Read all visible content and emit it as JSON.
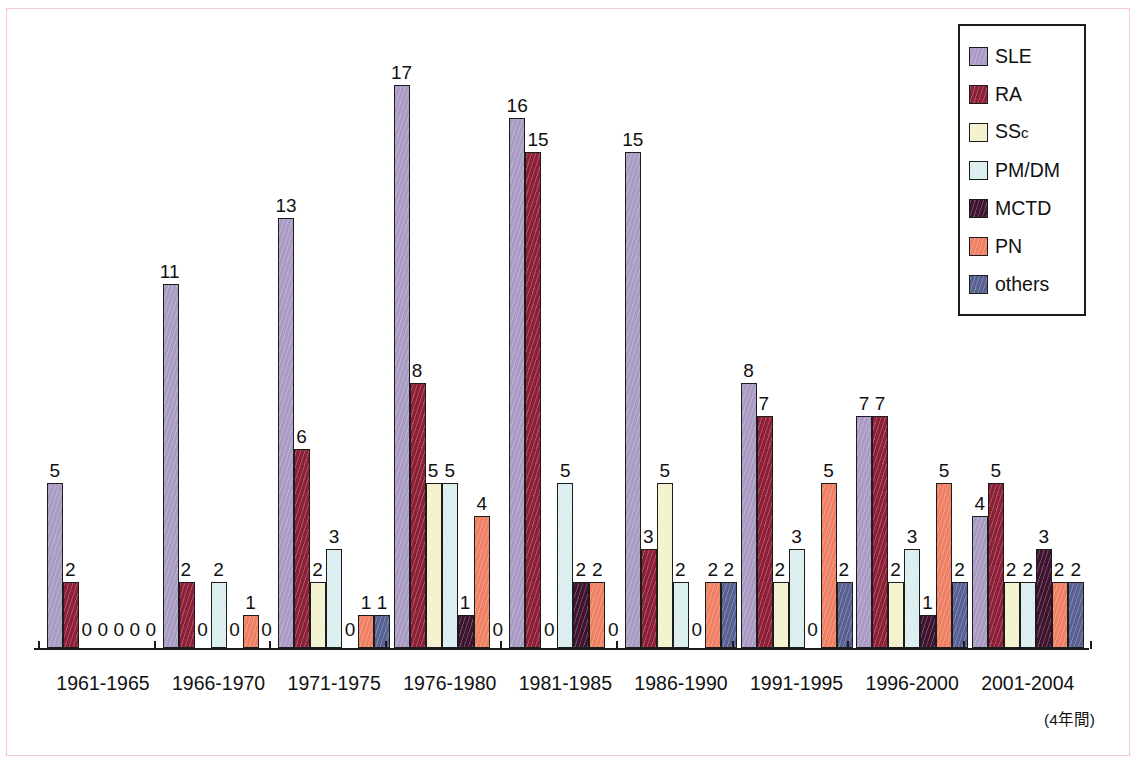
{
  "chart_data": {
    "type": "bar",
    "title": "",
    "subtitle": "",
    "xlabel": "",
    "ylabel": "",
    "grid": false,
    "legend_position": "top-right",
    "ylim": [
      0,
      17
    ],
    "note": "(4年間)",
    "categories": [
      "1961-1965",
      "1966-1970",
      "1971-1975",
      "1976-1980",
      "1981-1985",
      "1986-1990",
      "1991-1995",
      "1996-2000",
      "2001-2004"
    ],
    "series": [
      {
        "name": "SLE",
        "color": "#a99bc4",
        "values": [
          5,
          11,
          13,
          17,
          16,
          15,
          8,
          7,
          4
        ]
      },
      {
        "name": "RA",
        "color": "#8d2037",
        "values": [
          2,
          2,
          6,
          8,
          15,
          3,
          7,
          7,
          5
        ]
      },
      {
        "name": "SSc",
        "color": "#f4f2cc",
        "values": [
          0,
          0,
          2,
          5,
          0,
          5,
          2,
          2,
          2
        ]
      },
      {
        "name": "PM/DM",
        "color": "#daeef0",
        "values": [
          0,
          2,
          3,
          5,
          5,
          2,
          3,
          3,
          2
        ]
      },
      {
        "name": "MCTD",
        "color": "#3f1430",
        "values": [
          0,
          0,
          0,
          1,
          2,
          0,
          0,
          1,
          3
        ]
      },
      {
        "name": "PN",
        "color": "#ef8063",
        "values": [
          0,
          1,
          1,
          4,
          2,
          2,
          5,
          5,
          2
        ]
      },
      {
        "name": "others",
        "color": "#576192",
        "values": [
          0,
          0,
          1,
          0,
          0,
          2,
          2,
          2,
          2
        ]
      }
    ],
    "legend_labels": [
      "SLE",
      "RA",
      "SSc",
      "PM/DM",
      "MCTD",
      "PN",
      "others"
    ]
  },
  "legend": {
    "items": [
      {
        "label": "SLE",
        "label_main": "SLE",
        "label_sub": "",
        "color": "#a99bc4"
      },
      {
        "label": "RA",
        "label_main": "RA",
        "label_sub": "",
        "color": "#8d2037"
      },
      {
        "label": "SSc",
        "label_main": "SS",
        "label_sub": "c",
        "color": "#f4f2cc"
      },
      {
        "label": "PM/DM",
        "label_main": "PM/DM",
        "label_sub": "",
        "color": "#daeef0"
      },
      {
        "label": "MCTD",
        "label_main": "MCTD",
        "label_sub": "",
        "color": "#3f1430"
      },
      {
        "label": "PN",
        "label_main": "PN",
        "label_sub": "",
        "color": "#ef8063"
      },
      {
        "label": "others",
        "label_main": "others",
        "label_sub": "",
        "color": "#576192"
      }
    ]
  },
  "axis": {
    "note": "(4年間)"
  },
  "colors": {
    "page_border": "#f4c9cf",
    "axis": "#1c1c1c",
    "text": "#111111",
    "background": "#ffffff"
  }
}
